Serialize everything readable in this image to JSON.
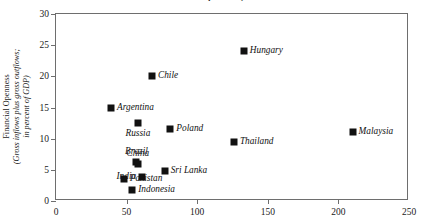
{
  "chart_data": {
    "type": "scatter",
    "title": "Financial Openness, 2005",
    "xlabel": "",
    "ylabel": "Financial Openness (Gross inflows plus gross outflows; in percent of GDP)",
    "ylabel_line1": "Financial Openness",
    "ylabel_line2": "(Gross inflows plus gross outflows;",
    "ylabel_line3": "in percent of GDP)",
    "xlim": [
      0,
      250
    ],
    "ylim": [
      0,
      30
    ],
    "xticks": [
      0,
      50,
      100,
      150,
      200,
      250
    ],
    "yticks": [
      0,
      5,
      10,
      15,
      20,
      25,
      30
    ],
    "grid": false,
    "legend": "none",
    "marker": "square",
    "marker_color": "#111111",
    "points": [
      {
        "label": "Argentina",
        "x": 39,
        "y": 15.0,
        "label_pos": "right"
      },
      {
        "label": "Chile",
        "x": 68,
        "y": 20.0,
        "label_pos": "right"
      },
      {
        "label": "Russia",
        "x": 58,
        "y": 12.5,
        "label_pos": "below"
      },
      {
        "label": "Poland",
        "x": 81,
        "y": 11.5,
        "label_pos": "right"
      },
      {
        "label": "Hungary",
        "x": 133,
        "y": 24.0,
        "label_pos": "right"
      },
      {
        "label": "Thailand",
        "x": 126,
        "y": 9.4,
        "label_pos": "right"
      },
      {
        "label": "Malaysia",
        "x": 210,
        "y": 11.0,
        "label_pos": "right"
      },
      {
        "label": "Brazil",
        "x": 57,
        "y": 6.2,
        "label_pos": "above"
      },
      {
        "label": "China",
        "x": 58,
        "y": 6.0,
        "label_pos": "above"
      },
      {
        "label": "India",
        "x": 61,
        "y": 3.8,
        "label_pos": "left"
      },
      {
        "label": "Pakistan",
        "x": 48,
        "y": 3.5,
        "label_pos": "right"
      },
      {
        "label": "Indonesia",
        "x": 54,
        "y": 1.8,
        "label_pos": "right"
      },
      {
        "label": "Sri Lanka",
        "x": 77,
        "y": 4.8,
        "label_pos": "right"
      }
    ]
  }
}
